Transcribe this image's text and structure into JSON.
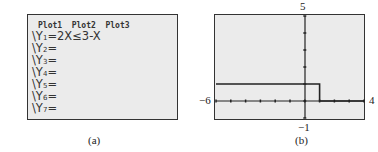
{
  "panel_a": {
    "plots": "Plot1  Plot2  Plot3",
    "lines": [
      {
        "prefix": "\\Y",
        "sub": "1",
        "expr": "=2X≤3-X"
      },
      {
        "prefix": "\\Y",
        "sub": "2",
        "expr": "="
      },
      {
        "prefix": "\\Y",
        "sub": "3",
        "expr": "="
      },
      {
        "prefix": "\\Y",
        "sub": "4",
        "expr": "="
      },
      {
        "prefix": "\\Y",
        "sub": "5",
        "expr": "="
      },
      {
        "prefix": "\\Y",
        "sub": "6",
        "expr": "="
      },
      {
        "prefix": "\\Y",
        "sub": "7",
        "expr": "="
      }
    ],
    "caption": "(a)"
  },
  "panel_b": {
    "caption": "(b)",
    "xmin_label": "−6",
    "xmax_label": "4",
    "ymin_label": "−1",
    "ymax_label": "5"
  },
  "chart_data": {
    "type": "line",
    "title": "",
    "function": "Y1 = 2X ≤ 3 − X",
    "xlabel": "",
    "ylabel": "",
    "xlim": [
      -6,
      4
    ],
    "ylim": [
      -1,
      5
    ],
    "xscale": 1,
    "yscale": 1,
    "grid": false,
    "series": [
      {
        "name": "Y1",
        "x": [
          -6,
          1,
          1,
          4
        ],
        "y": [
          1,
          1,
          0,
          0
        ]
      }
    ]
  }
}
